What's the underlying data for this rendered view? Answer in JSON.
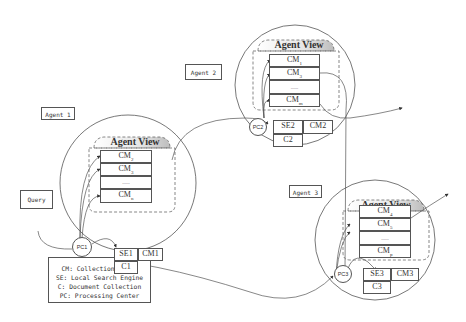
{
  "diagram": {
    "query_label": "Query",
    "legend": [
      "CM: Collection Model",
      "SE: Local Search Engine",
      "C: Document Collection",
      "PC: Processing Center"
    ],
    "agents": [
      {
        "label": "Agent 1",
        "view_title": "Agent View",
        "pc": "PC1",
        "models": [
          {
            "base": "CM",
            "sub": "2"
          },
          {
            "base": "CM",
            "sub": "3"
          },
          {
            "base": "......",
            "sub": ""
          },
          {
            "base": "CM",
            "sub": "n"
          }
        ],
        "se": "SE1",
        "cm": "CM1",
        "c": "C1"
      },
      {
        "label": "Agent 2",
        "view_title": "Agent View",
        "pc": "PC2",
        "models": [
          {
            "base": "CM",
            "sub": "1"
          },
          {
            "base": "CM",
            "sub": "3"
          },
          {
            "base": "......",
            "sub": ""
          },
          {
            "base": "CM",
            "sub": "m"
          }
        ],
        "se": "SE2",
        "cm": "CM2",
        "c": "C2"
      },
      {
        "label": "Agent 3",
        "view_title": "Agent View",
        "pc": "PC3",
        "models": [
          {
            "base": "CM",
            "sub": "4"
          },
          {
            "base": "CM",
            "sub": "5"
          },
          {
            "base": "......",
            "sub": ""
          },
          {
            "base": "CM",
            "sub": "p"
          }
        ],
        "se": "SE3",
        "cm": "CM3",
        "c": "C3"
      }
    ]
  }
}
